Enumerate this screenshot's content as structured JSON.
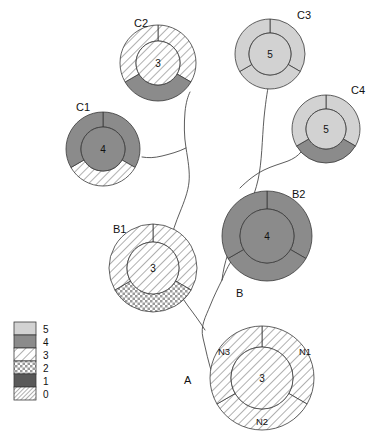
{
  "diagram": {
    "title": "",
    "type": "phylogenetic-tree-with-donut-nodes",
    "background": "#ffffff",
    "stroke_color": "#3a3a3a",
    "branch_color": "#4a4a4a"
  },
  "patterns": {
    "5": {
      "label": "5",
      "kind": "solid",
      "color": "#d2d2d2"
    },
    "4": {
      "label": "4",
      "kind": "solid",
      "color": "#8b8b8b"
    },
    "3": {
      "label": "3",
      "kind": "diagonal-hatch",
      "color": "#ffffff"
    },
    "2": {
      "label": "2",
      "kind": "checker",
      "color": "#ffffff"
    },
    "1": {
      "label": "1",
      "kind": "solid",
      "color": "#595959"
    },
    "0": {
      "label": "0",
      "kind": "dense-hatch",
      "color": "#ffffff"
    }
  },
  "legend": {
    "name": "state-legend",
    "x": 14,
    "y": 322,
    "swatch_width": 22,
    "swatch_height": 13,
    "entries": [
      {
        "label": "5",
        "pattern": "5"
      },
      {
        "label": "4",
        "pattern": "4"
      },
      {
        "label": "3",
        "pattern": "3"
      },
      {
        "label": "2",
        "pattern": "2"
      },
      {
        "label": "1",
        "pattern": "1"
      },
      {
        "label": "0",
        "pattern": "0"
      }
    ]
  },
  "tip_labels": [
    {
      "name": "tip-label-a",
      "text": "A",
      "x": 184,
      "y": 384
    },
    {
      "name": "tip-label-b",
      "text": "B",
      "x": 236,
      "y": 297
    }
  ],
  "nodes": [
    {
      "id": "A",
      "name": "node-a",
      "label": "",
      "label_x": 0,
      "label_y": 0,
      "cx": 262,
      "cy": 378,
      "r_outer": 52,
      "r_inner": 31,
      "core_value": "3",
      "core_pattern": "3",
      "segments": [
        {
          "id": "N1",
          "label": "N1",
          "pattern": "3",
          "lx": 299,
          "ly": 355
        },
        {
          "id": "N2",
          "label": "N2",
          "pattern": "3",
          "lx": 256,
          "ly": 425
        },
        {
          "id": "N3",
          "label": "N3",
          "pattern": "3",
          "lx": 218,
          "ly": 355
        }
      ]
    },
    {
      "id": "B1",
      "name": "node-b1",
      "label": "B1",
      "label_x": 113,
      "label_y": 233,
      "cx": 153,
      "cy": 268,
      "r_outer": 44,
      "r_inner": 26,
      "core_value": "3",
      "core_pattern": "3",
      "segments": [
        {
          "id": "N1",
          "label": "",
          "pattern": "3",
          "lx": 0,
          "ly": 0
        },
        {
          "id": "N2",
          "label": "",
          "pattern": "2",
          "lx": 0,
          "ly": 0
        },
        {
          "id": "N3",
          "label": "",
          "pattern": "3",
          "lx": 0,
          "ly": 0
        }
      ]
    },
    {
      "id": "B2",
      "name": "node-b2",
      "label": "B2",
      "label_x": 292,
      "label_y": 198,
      "cx": 267,
      "cy": 236,
      "r_outer": 45,
      "r_inner": 27,
      "core_value": "4",
      "core_pattern": "4",
      "segments": [
        {
          "id": "N1",
          "label": "",
          "pattern": "4",
          "lx": 0,
          "ly": 0
        },
        {
          "id": "N2",
          "label": "",
          "pattern": "4",
          "lx": 0,
          "ly": 0
        },
        {
          "id": "N3",
          "label": "",
          "pattern": "4",
          "lx": 0,
          "ly": 0
        }
      ]
    },
    {
      "id": "C1",
      "name": "node-c1",
      "label": "C1",
      "label_x": 76,
      "label_y": 111,
      "cx": 103,
      "cy": 149,
      "r_outer": 37,
      "r_inner": 22,
      "core_value": "4",
      "core_pattern": "4",
      "segments": [
        {
          "id": "N1",
          "label": "",
          "pattern": "4",
          "lx": 0,
          "ly": 0
        },
        {
          "id": "N2",
          "label": "",
          "pattern": "3",
          "lx": 0,
          "ly": 0
        },
        {
          "id": "N3",
          "label": "",
          "pattern": "4",
          "lx": 0,
          "ly": 0
        }
      ]
    },
    {
      "id": "C2",
      "name": "node-c2",
      "label": "C2",
      "label_x": 134,
      "label_y": 27,
      "cx": 158,
      "cy": 63,
      "r_outer": 38,
      "r_inner": 22,
      "core_value": "3",
      "core_pattern": "3",
      "segments": [
        {
          "id": "N1",
          "label": "",
          "pattern": "3",
          "lx": 0,
          "ly": 0
        },
        {
          "id": "N2",
          "label": "",
          "pattern": "4",
          "lx": 0,
          "ly": 0
        },
        {
          "id": "N3",
          "label": "",
          "pattern": "3",
          "lx": 0,
          "ly": 0
        }
      ]
    },
    {
      "id": "C3",
      "name": "node-c3",
      "label": "C3",
      "label_x": 297,
      "label_y": 19,
      "cx": 270,
      "cy": 54,
      "r_outer": 35,
      "r_inner": 21,
      "core_value": "5",
      "core_pattern": "5",
      "segments": [
        {
          "id": "N1",
          "label": "",
          "pattern": "5",
          "lx": 0,
          "ly": 0
        },
        {
          "id": "N2",
          "label": "",
          "pattern": "5",
          "lx": 0,
          "ly": 0
        },
        {
          "id": "N3",
          "label": "",
          "pattern": "5",
          "lx": 0,
          "ly": 0
        }
      ]
    },
    {
      "id": "C4",
      "name": "node-c4",
      "label": "C4",
      "label_x": 351,
      "label_y": 94,
      "cx": 326,
      "cy": 129,
      "r_outer": 34,
      "r_inner": 20,
      "core_value": "5",
      "core_pattern": "5",
      "segments": [
        {
          "id": "N1",
          "label": "",
          "pattern": "5",
          "lx": 0,
          "ly": 0
        },
        {
          "id": "N2",
          "label": "",
          "pattern": "4",
          "lx": 0,
          "ly": 0
        },
        {
          "id": "N3",
          "label": "",
          "pattern": "5",
          "lx": 0,
          "ly": 0
        }
      ]
    }
  ],
  "branches": [
    {
      "name": "branch-root-to-b",
      "d": "M 213 376 C 208 362 206 350 203 338 C 200 326 206 316 210 306 C 214 296 218 288 222 280"
    },
    {
      "name": "branch-b-to-b2",
      "d": "M 222 280 C 226 270 230 262 235 256 C 240 250 247 245 252 242"
    },
    {
      "name": "branch-b-to-c3",
      "d": "M 222 280 C 224 262 230 246 238 230 C 246 214 254 198 258 180 C 262 162 262 140 264 118 C 266 98 268 88 269 82"
    },
    {
      "name": "branch-b2-to-c4",
      "d": "M 240 188 C 248 180 256 174 264 170 C 272 166 280 164 288 161 C 293 159 298 156 301 152"
    },
    {
      "name": "branch-root-to-b1-upper",
      "d": "M 205 330 C 200 322 194 314 188 306 C 182 298 178 290 175 282 C 172 274 171 266 170 258"
    },
    {
      "name": "branch-b1-to-c2",
      "d": "M 170 244 C 172 232 176 222 180 212 C 184 202 188 192 189 182 C 190 172 188 160 186 148 C 184 136 184 124 185 112 C 186 102 188 96 190 92"
    },
    {
      "name": "branch-c-to-c1",
      "d": "M 186 148 C 178 152 170 154 162 156 C 154 158 148 158 142 157"
    }
  ]
}
